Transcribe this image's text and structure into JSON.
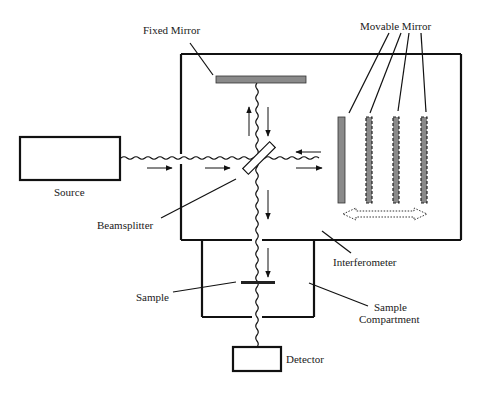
{
  "diagram": {
    "labels": {
      "fixed_mirror": "Fixed Mirror",
      "movable_mirror": "Movable Mirror",
      "source": "Source",
      "beamsplitter": "Beamsplitter",
      "interferometer": "Interferometer",
      "sample": "Sample",
      "sample_compartment_line1": "Sample",
      "sample_compartment_line2": "Compartment",
      "detector": "Detector"
    },
    "components": [
      {
        "id": "source",
        "shape": "rectangle"
      },
      {
        "id": "interferometer",
        "shape": "rectangle"
      },
      {
        "id": "fixed_mirror",
        "shape": "bar",
        "color": "#8a8a8a"
      },
      {
        "id": "beamsplitter",
        "shape": "tilted-plate"
      },
      {
        "id": "movable_mirror",
        "shape": "bar",
        "positions": 4,
        "color": "#8a8a8a"
      },
      {
        "id": "sample_compartment",
        "shape": "rectangle"
      },
      {
        "id": "sample",
        "shape": "bar"
      },
      {
        "id": "detector",
        "shape": "rectangle"
      }
    ],
    "connections": [
      {
        "from": "source",
        "to": "beamsplitter",
        "type": "wavy-beam"
      },
      {
        "from": "beamsplitter",
        "to": "fixed_mirror",
        "type": "wavy-beam",
        "bidirectional": true
      },
      {
        "from": "beamsplitter",
        "to": "movable_mirror",
        "type": "wavy-beam",
        "bidirectional": true
      },
      {
        "from": "beamsplitter",
        "to": "sample",
        "type": "wavy-beam"
      },
      {
        "from": "sample",
        "to": "detector",
        "type": "wavy-beam"
      }
    ],
    "motion_indicator": "dotted double-headed arrow (mirror travel)"
  }
}
